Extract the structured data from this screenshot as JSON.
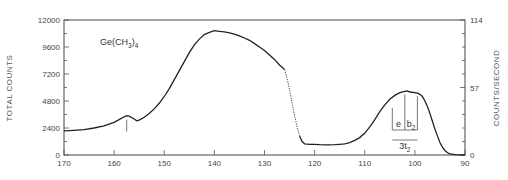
{
  "chart_data": {
    "type": "line",
    "title": "",
    "annotation_label": {
      "base": "Ge(CH",
      "sub": "3",
      "close": ")",
      "sub2": "4"
    },
    "xlabel": "",
    "ylabel": "TOTAL COUNTS",
    "y2label": "COUNTS/SECOND",
    "xlim": [
      170,
      90
    ],
    "ylim": [
      0,
      12000
    ],
    "y2lim": [
      0,
      114
    ],
    "x_ticks": [
      170,
      160,
      150,
      140,
      130,
      120,
      110,
      100,
      90
    ],
    "x_tick_labels": [
      "170",
      "160",
      "150",
      "140",
      "130",
      "120",
      "110",
      "100",
      "90"
    ],
    "y_ticks": [
      0,
      2400,
      4800,
      7200,
      9600,
      12000
    ],
    "y_tick_labels": [
      "0",
      "2400",
      "4800",
      "7200",
      "9600",
      "12000"
    ],
    "y2_ticks": [
      0,
      57,
      114
    ],
    "y2_tick_labels": [
      "0",
      "57",
      "114"
    ],
    "grid": false,
    "series": [
      {
        "name": "Ge(CH3)4 spectrum",
        "x": [
          170,
          168,
          166,
          164,
          162,
          160,
          159,
          158,
          157.5,
          157,
          156,
          155.5,
          155,
          154,
          153,
          152,
          151,
          150,
          149,
          148,
          147,
          146,
          145,
          144,
          143,
          142,
          141,
          140,
          139,
          138,
          137,
          136,
          135,
          134,
          133,
          132,
          131,
          130,
          129,
          128,
          127,
          126,
          125.5,
          125,
          124.5,
          124,
          123.5,
          123,
          122.5,
          122,
          121,
          120,
          119,
          118,
          117,
          116,
          115,
          114,
          113,
          112,
          111,
          110,
          109,
          108,
          107,
          106,
          105,
          104,
          103,
          102,
          101.5,
          101,
          100,
          99.5,
          99,
          98.5,
          98,
          97.5,
          97,
          96.5,
          96,
          95.5,
          95,
          94.5,
          94,
          93.5,
          93,
          92,
          91,
          90
        ],
        "y": [
          2150,
          2200,
          2250,
          2400,
          2600,
          2900,
          3150,
          3400,
          3500,
          3450,
          3200,
          3050,
          3100,
          3350,
          3700,
          4100,
          4600,
          5200,
          5900,
          6700,
          7500,
          8300,
          9100,
          9800,
          10300,
          10700,
          10900,
          11050,
          11000,
          10950,
          10850,
          10750,
          10600,
          10400,
          10200,
          9900,
          9600,
          9300,
          8900,
          8500,
          8000,
          7600,
          6800,
          5800,
          4600,
          3500,
          2500,
          1700,
          1200,
          1000,
          950,
          950,
          920,
          900,
          900,
          920,
          950,
          1000,
          1100,
          1300,
          1550,
          1950,
          2500,
          3150,
          3850,
          4450,
          4950,
          5300,
          5550,
          5650,
          5700,
          5600,
          5550,
          5500,
          5400,
          5200,
          4800,
          4300,
          3700,
          3000,
          2300,
          1700,
          1100,
          700,
          400,
          200,
          100,
          40,
          10,
          0
        ]
      }
    ],
    "peak_markers": [
      {
        "x": 157.5,
        "label": ""
      },
      {
        "x": 104.5,
        "label": ""
      },
      {
        "x": 102,
        "label": ""
      },
      {
        "x": 99.5,
        "label": ""
      }
    ],
    "brackets": [
      {
        "from": 104.5,
        "to": 102,
        "label": "e",
        "sub": ""
      },
      {
        "from": 102,
        "to": 99.5,
        "label": "b",
        "sub": "2"
      },
      {
        "from": 104.5,
        "to": 99.5,
        "label": "3t",
        "sub": "2"
      }
    ]
  }
}
